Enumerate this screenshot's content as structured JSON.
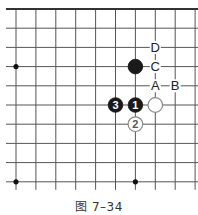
{
  "diagram": {
    "type": "go-board-fragment",
    "caption": "图 7–34",
    "grid": {
      "columns": 10,
      "rows": 10,
      "x0": 16,
      "dx": 19.9,
      "y0": 9,
      "dy": 19.2,
      "top_edge": true,
      "line_color": "#555555",
      "edge_color": "#333333"
    },
    "star_points": [
      {
        "col": 0,
        "row": 3
      },
      {
        "col": 0,
        "row": 9
      },
      {
        "col": 6,
        "row": 9
      }
    ],
    "stones": [
      {
        "col": 6,
        "row": 3,
        "color": "black",
        "label": ""
      },
      {
        "col": 6,
        "row": 5,
        "color": "black",
        "label": "1"
      },
      {
        "col": 7,
        "row": 5,
        "color": "white",
        "label": ""
      },
      {
        "col": 6,
        "row": 6,
        "color": "white",
        "label": "2"
      },
      {
        "col": 5,
        "row": 5,
        "color": "black",
        "label": "3"
      }
    ],
    "markers": [
      {
        "col": 7,
        "row": 2,
        "label": "D"
      },
      {
        "col": 7,
        "row": 3,
        "label": "C"
      },
      {
        "col": 7,
        "row": 4,
        "label": "A"
      },
      {
        "col": 8,
        "row": 4,
        "label": "B"
      }
    ]
  }
}
